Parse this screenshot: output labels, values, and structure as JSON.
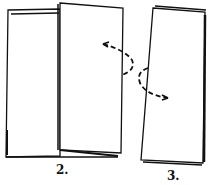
{
  "diagram": {
    "type": "paper-folding-steps",
    "steps": [
      {
        "label": "2.",
        "description": "Sheet folded in half, right panel standing open over left panel"
      },
      {
        "label": "3.",
        "description": "Folded booklet with right panel folded behind"
      }
    ],
    "arrows": [
      {
        "style": "dashed",
        "direction": "curved fold arrow from step 2 right edge toward left"
      },
      {
        "style": "dashed",
        "direction": "curved fold arrow on step 3 left edge toward right"
      }
    ],
    "colors": {
      "line": "#111111",
      "background": "#ffffff"
    }
  }
}
